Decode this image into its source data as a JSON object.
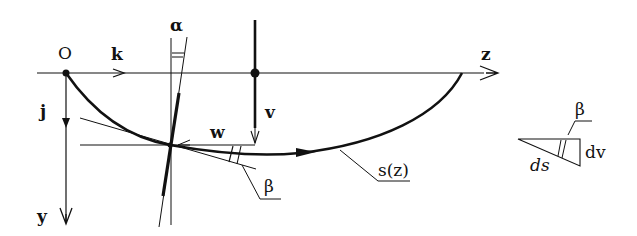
{
  "diagram": {
    "type": "mechanics-geometry",
    "colors": {
      "ink": "#111111",
      "background": "#ffffff"
    }
  },
  "labels": {
    "origin": "O",
    "k": "k",
    "j": "j",
    "y_axis": "y",
    "z_axis": "z",
    "alpha": "α",
    "v": "v",
    "w": "w",
    "beta_main": "β",
    "curve": "s(z)",
    "inset_beta": "β",
    "inset_dv": "dv",
    "inset_ds": "ds"
  },
  "geometry": {
    "horizontal_axis": {
      "x1": 37,
      "y": 73,
      "x2": 498
    },
    "vertical_axis": {
      "x": 66,
      "y1": 73,
      "y2": 225
    },
    "origin_point": {
      "x": 66,
      "y": 73
    },
    "rod_v": {
      "x": 255,
      "y1": 20,
      "y2": 143,
      "pivot_y": 73
    },
    "line_w": {
      "x1": 80,
      "x2": 255,
      "y": 145
    },
    "intersection": {
      "x": 170,
      "y": 145
    },
    "curve_end": {
      "x": 462,
      "y": 73
    }
  }
}
